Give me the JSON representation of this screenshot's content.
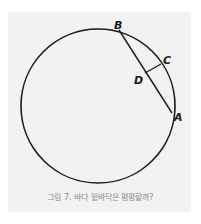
{
  "figure": {
    "caption": "그림 7. 바다 밑바닥은 평평할까?",
    "colors": {
      "background": "#ffffff",
      "panel": "#f2f2f2",
      "stroke": "#1a1a1a",
      "caption": "#8a8a8a"
    },
    "circle": {
      "cx": 98,
      "cy": 106,
      "r": 77
    },
    "points": {
      "A": {
        "label": "A",
        "x": 172,
        "y": 113
      },
      "B": {
        "label": "B",
        "x": 119,
        "y": 30
      },
      "C": {
        "label": "C",
        "x": 161,
        "y": 64
      },
      "D": {
        "label": "D",
        "x": 145,
        "y": 73
      }
    },
    "segments": [
      {
        "from": "B",
        "to": "A",
        "name": "chord-BA"
      },
      {
        "from": "D",
        "to": "C",
        "name": "sagitta-DC"
      }
    ]
  }
}
